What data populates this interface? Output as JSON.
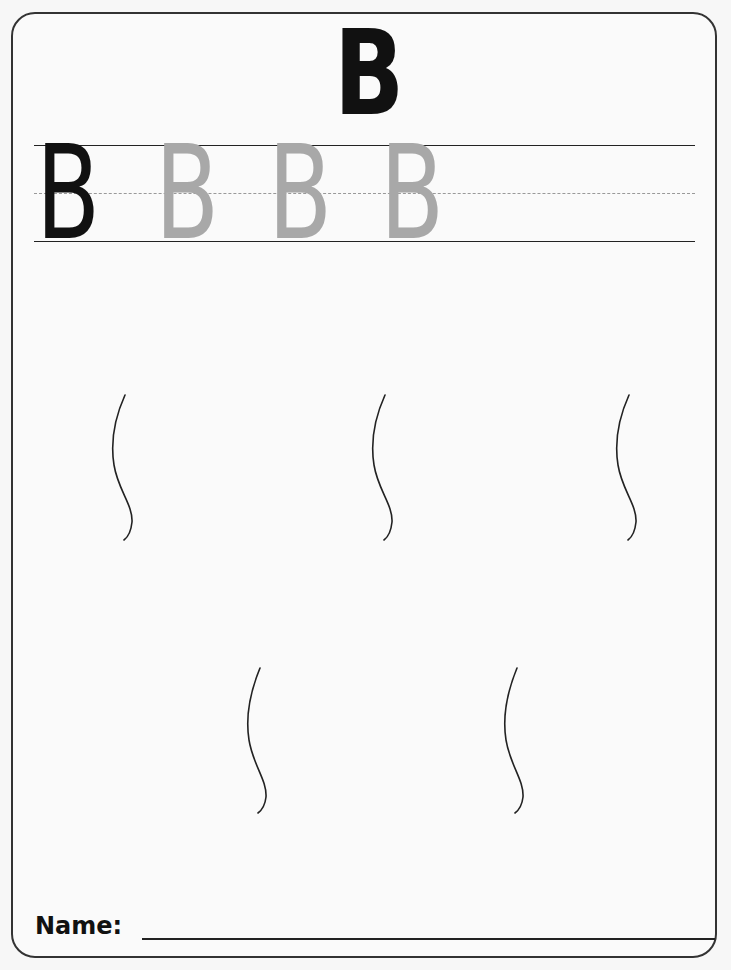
{
  "worksheet": {
    "title_letter": "B",
    "tracing_row": {
      "model_letter": "B",
      "trace_letters": [
        "B",
        "B",
        "B"
      ]
    },
    "wavy_paths_count": 5,
    "name_label": "Name:",
    "colors": {
      "ink": "#111111",
      "trace": "#a8a8a8",
      "midline": "#999999",
      "border": "#333333"
    }
  }
}
